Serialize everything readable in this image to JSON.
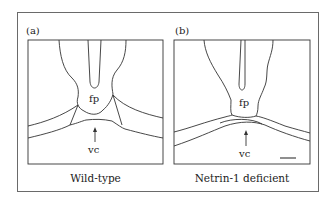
{
  "figure": {
    "panels": [
      {
        "id": "a",
        "label": "(a)",
        "caption": "Wild-type",
        "structures": {
          "floor_plate": "fp",
          "ventral_commissure": "vc"
        }
      },
      {
        "id": "b",
        "label": "(b)",
        "caption": "Netrin-1 deficient",
        "structures": {
          "floor_plate": "fp",
          "ventral_commissure": "vc"
        },
        "scale_bar": true
      }
    ],
    "colors": {
      "line": "#333333",
      "frame": "#6a6a6a",
      "background": "#ffffff"
    }
  }
}
